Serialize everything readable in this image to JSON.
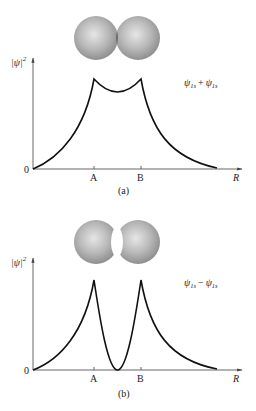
{
  "panels": [
    {
      "id": "a",
      "caption": "(a)",
      "y_label": "|ψ|",
      "y_label_sup": "2",
      "x_label": "R",
      "origin_label": "0",
      "tick_labels": [
        "A",
        "B"
      ],
      "equation": {
        "psi1": "ψ",
        "sub1": "1s",
        "op": "+",
        "psi2": "ψ",
        "sub2": "1s"
      },
      "description": "Bonding combination: electron density builds up between nuclei A and B",
      "spheres": "overlapping, dark shaded overlap region"
    },
    {
      "id": "b",
      "caption": "(b)",
      "y_label": "|ψ|",
      "y_label_sup": "2",
      "x_label": "R",
      "origin_label": "0",
      "tick_labels": [
        "A",
        "B"
      ],
      "equation": {
        "psi1": "ψ",
        "sub1": "1s",
        "op": "−",
        "psi2": "ψ",
        "sub2": "1s"
      },
      "description": "Antibonding combination: node with zero density midway between nuclei A and B",
      "spheres": "separated, white gap (node) between"
    }
  ],
  "colors": {
    "curve": "#111111",
    "axis": "#555555",
    "sphere_light": "#d8d8d8",
    "sphere_dark": "#8a8a8a",
    "overlap": "#5e5e5e"
  }
}
